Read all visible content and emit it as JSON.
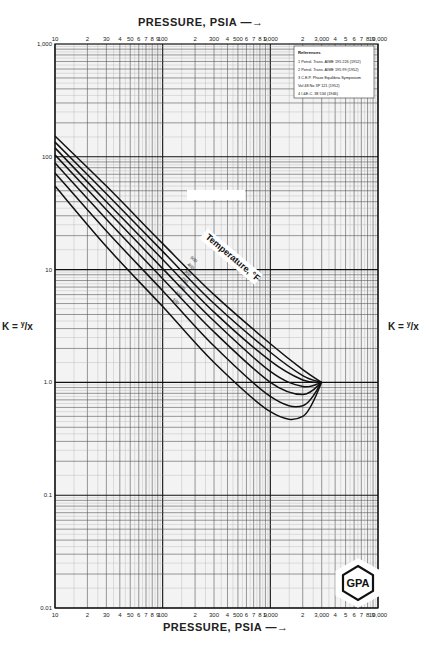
{
  "chart_data": {
    "type": "line",
    "title": "",
    "xlabel": "PRESSURE, PSIA",
    "ylabel": "K = y/x",
    "x_scale": "log",
    "y_scale": "log",
    "xlim": [
      10,
      10000
    ],
    "ylim": [
      0.01,
      1000
    ],
    "grid": true,
    "x_tick_labels": [
      "10",
      "2",
      "30",
      "4",
      "50",
      "6",
      "7",
      "8",
      "9",
      "100",
      "2",
      "300",
      "4",
      "500",
      "6",
      "7",
      "8",
      "9",
      "1,000",
      "2",
      "3,000",
      "4",
      "5",
      "6",
      "7",
      "8",
      "9",
      "10,000"
    ],
    "x_major_ticks": [
      10,
      100,
      1000,
      10000
    ],
    "y_tick_labels": [
      "1,000",
      "100",
      "10",
      "1.0",
      "0.1",
      "0.01"
    ],
    "y_major_ticks": [
      1000,
      100,
      10,
      1.0,
      0.1,
      0.01
    ],
    "annotation": "Temperature, °F",
    "convergence_pressure_psia": 3000,
    "series": [
      {
        "name": "500",
        "x": [
          10,
          30,
          100,
          300,
          1000,
          2000,
          3000
        ],
        "values": [
          153,
          55,
          17,
          6.0,
          2.2,
          1.3,
          1.0
        ]
      },
      {
        "name": "400",
        "x": [
          10,
          30,
          100,
          300,
          1000,
          2000,
          3000
        ],
        "values": [
          135,
          47,
          14.5,
          5.0,
          1.85,
          1.15,
          1.0
        ]
      },
      {
        "name": "300",
        "x": [
          10,
          30,
          100,
          300,
          1000,
          2000,
          3000
        ],
        "values": [
          120,
          40,
          12.3,
          4.2,
          1.55,
          1.05,
          1.0
        ]
      },
      {
        "name": "250",
        "x": [
          10,
          30,
          100,
          300,
          1000,
          2000,
          3000
        ],
        "values": [
          104,
          34,
          10.2,
          3.5,
          1.25,
          0.92,
          1.0
        ]
      },
      {
        "name": "200",
        "x": [
          10,
          30,
          100,
          300,
          1000,
          2000,
          3000
        ],
        "values": [
          88,
          28,
          8.3,
          2.8,
          1.0,
          0.78,
          1.0
        ]
      },
      {
        "name": "150",
        "x": [
          10,
          30,
          100,
          300,
          1000,
          2000,
          3000
        ],
        "values": [
          72,
          22,
          6.5,
          2.1,
          0.75,
          0.62,
          1.0
        ]
      },
      {
        "name": "100",
        "x": [
          10,
          30,
          100,
          300,
          1000,
          2000,
          3000
        ],
        "values": [
          55,
          16,
          4.7,
          1.5,
          0.55,
          0.5,
          1.0
        ]
      }
    ],
    "legend": {
      "title": "References",
      "entries": [
        "1  Petrol. Trans. AIME 195 226 (1952)",
        "2  Petrol. Trans. AIME 195 99 (1952)",
        "3  C.E.P. Phase Equilibria Symposium",
        "    Vol 48 No 3P 121 (1952)",
        "4  I.&E.C. 38 534 (1946)"
      ],
      "position": "top-right"
    }
  },
  "labels": {
    "top_axis_title": "PRESSURE, PSIA —→",
    "bottom_axis_title": "PRESSURE, PSIA —→",
    "left_k_label": "K = ",
    "left_k_num": "y",
    "left_k_den": "/x",
    "right_k_label": "K = ",
    "right_k_num": "y",
    "right_k_den": "/x",
    "temperature_label": "Temperature, °F",
    "logo_text": "GPA"
  }
}
